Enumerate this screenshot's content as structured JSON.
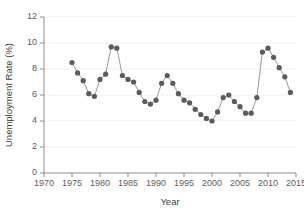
{
  "chart_data": {
    "type": "line",
    "title": "",
    "xlabel": "Year",
    "ylabel": "Unemployment Rate (%)",
    "xlim": [
      1970,
      2015
    ],
    "ylim": [
      0,
      12
    ],
    "xticks": [
      1970,
      1975,
      1980,
      1985,
      1990,
      1995,
      2000,
      2005,
      2010,
      2015
    ],
    "yticks": [
      0,
      2,
      4,
      6,
      8,
      10,
      12
    ],
    "grid": "horizontal-light",
    "legend": "none",
    "marker": "filled-circle",
    "marker_color": "#5b5b5b",
    "line_color": "#9a9a9a",
    "x": [
      1975,
      1976,
      1977,
      1978,
      1979,
      1980,
      1981,
      1982,
      1983,
      1984,
      1985,
      1986,
      1987,
      1988,
      1989,
      1990,
      1991,
      1992,
      1993,
      1994,
      1995,
      1996,
      1997,
      1998,
      1999,
      2000,
      2001,
      2002,
      2003,
      2004,
      2005,
      2006,
      2007,
      2008,
      2009,
      2010,
      2011,
      2012,
      2013,
      2014
    ],
    "values": [
      8.5,
      7.7,
      7.1,
      6.1,
      5.9,
      7.2,
      7.6,
      9.7,
      9.6,
      7.5,
      7.2,
      7.0,
      6.2,
      5.5,
      5.3,
      5.6,
      6.9,
      7.5,
      6.9,
      6.1,
      5.6,
      5.4,
      4.9,
      4.5,
      4.2,
      4.0,
      4.7,
      5.8,
      6.0,
      5.5,
      5.1,
      4.6,
      4.6,
      5.8,
      9.3,
      9.6,
      8.9,
      8.1,
      7.4,
      6.2
    ],
    "series": [
      {
        "name": "Unemployment Rate",
        "values": [
          8.5,
          7.7,
          7.1,
          6.1,
          5.9,
          7.2,
          7.6,
          9.7,
          9.6,
          7.5,
          7.2,
          7.0,
          6.2,
          5.5,
          5.3,
          5.6,
          6.9,
          7.5,
          6.9,
          6.1,
          5.6,
          5.4,
          4.9,
          4.5,
          4.2,
          4.0,
          4.7,
          5.8,
          6.0,
          5.5,
          5.1,
          4.6,
          4.6,
          5.8,
          9.3,
          9.6,
          8.9,
          8.1,
          7.4,
          6.2
        ]
      }
    ]
  }
}
